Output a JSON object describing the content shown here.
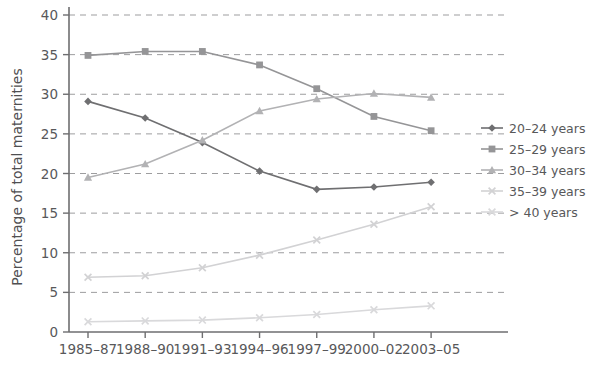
{
  "chart_data": {
    "type": "line",
    "title": "",
    "xlabel": "",
    "ylabel": "Percentage of total maternities",
    "ylim": [
      0,
      40
    ],
    "ytick_step": 5,
    "yticks": [
      "0",
      "5",
      "10",
      "15",
      "20",
      "25",
      "30",
      "35",
      "40"
    ],
    "grid": true,
    "legend_position": "right",
    "categories": [
      "1985–87",
      "1988–90",
      "1991–93",
      "1994–96",
      "1997–99",
      "2000–02",
      "2003–05"
    ],
    "series": [
      {
        "name": "20–24 years",
        "marker": "diamond",
        "color": "#6f6f71",
        "values": [
          29.1,
          27.0,
          23.9,
          20.3,
          18.0,
          18.3,
          18.9
        ]
      },
      {
        "name": "25–29 years",
        "marker": "square",
        "color": "#959597",
        "values": [
          34.9,
          35.4,
          35.4,
          33.7,
          30.7,
          27.2,
          25.4
        ]
      },
      {
        "name": "30–34 years",
        "marker": "triangle",
        "color": "#b2b2b4",
        "values": [
          19.5,
          21.2,
          24.2,
          27.9,
          29.4,
          30.1,
          29.6
        ]
      },
      {
        "name": "35–39 years",
        "marker": "x",
        "color": "#d2d2d4",
        "values": [
          6.9,
          7.1,
          8.1,
          9.7,
          11.6,
          13.6,
          15.8
        ]
      },
      {
        "name": "> 40 years",
        "marker": "x",
        "color": "#d9d9db",
        "values": [
          1.3,
          1.4,
          1.5,
          1.8,
          2.2,
          2.8,
          3.3
        ]
      }
    ]
  }
}
